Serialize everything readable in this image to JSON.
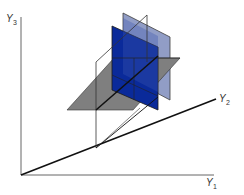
{
  "figure": {
    "type": "3d-axes-with-planes",
    "axes": {
      "y1": {
        "label": "Y",
        "subscript": "1"
      },
      "y2": {
        "label": "Y",
        "subscript": "2"
      },
      "y3": {
        "label": "Y",
        "subscript": "3"
      }
    },
    "planes": [
      {
        "name": "gray-horizontal-plane",
        "color": "#7f7f7f"
      },
      {
        "name": "wireframe-vertical-plane",
        "color": "#ffffff",
        "stroke": "#222222"
      },
      {
        "name": "dark-blue-plane",
        "color": "#0a2a9a"
      },
      {
        "name": "light-blue-plane",
        "color": "#8c98c4"
      }
    ],
    "colors": {
      "axis": "#555555",
      "axis_dark": "#111111",
      "background": "#ffffff"
    }
  }
}
